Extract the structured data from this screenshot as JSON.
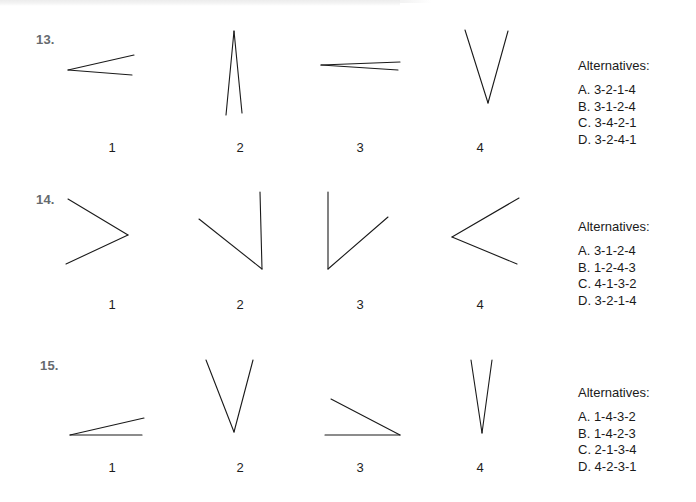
{
  "document": {
    "type": "multiple-choice-figure-worksheet",
    "ink_color": "#1a1a1a",
    "number_color": "#666a6e",
    "background_color": "#ffffff"
  },
  "items": [
    {
      "number": "13.",
      "figures": [
        {
          "label": "1",
          "name": "angle-figure-13-1"
        },
        {
          "label": "2",
          "name": "angle-figure-13-2"
        },
        {
          "label": "3",
          "name": "angle-figure-13-3"
        },
        {
          "label": "4",
          "name": "angle-figure-13-4"
        }
      ],
      "alternatives": {
        "title": "Alternatives:",
        "options": [
          "A. 3-2-1-4",
          "B. 3-1-2-4",
          "C. 3-4-2-1",
          "D. 3-2-4-1"
        ]
      }
    },
    {
      "number": "14.",
      "figures": [
        {
          "label": "1",
          "name": "angle-figure-14-1"
        },
        {
          "label": "2",
          "name": "angle-figure-14-2"
        },
        {
          "label": "3",
          "name": "angle-figure-14-3"
        },
        {
          "label": "4",
          "name": "angle-figure-14-4"
        }
      ],
      "alternatives": {
        "title": "Alternatives:",
        "options": [
          "A. 3-1-2-4",
          "B. 1-2-4-3",
          "C. 4-1-3-2",
          "D. 3-2-1-4"
        ]
      }
    },
    {
      "number": "15.",
      "figures": [
        {
          "label": "1",
          "name": "angle-figure-15-1"
        },
        {
          "label": "2",
          "name": "angle-figure-15-2"
        },
        {
          "label": "3",
          "name": "angle-figure-15-3"
        },
        {
          "label": "4",
          "name": "angle-figure-15-4"
        }
      ],
      "alternatives": {
        "title": "Alternatives:",
        "options": [
          "A. 1-4-3-2",
          "B. 1-4-2-3",
          "C. 2-1-3-4",
          "D. 4-2-3-1"
        ]
      }
    }
  ]
}
